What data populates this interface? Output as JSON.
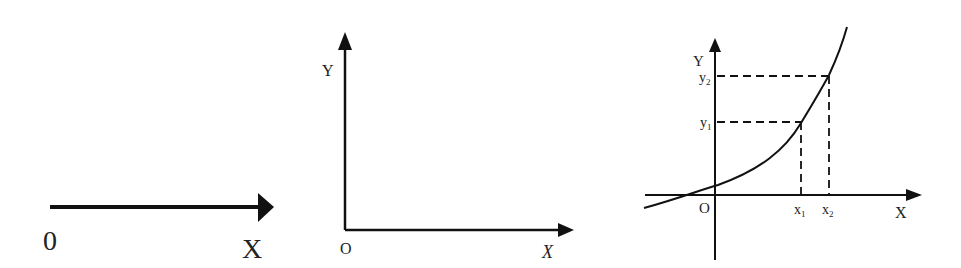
{
  "diagrams": [
    {
      "id": "number-line",
      "labels": {
        "origin": "0",
        "x_axis": "X"
      }
    },
    {
      "id": "empty-axes",
      "labels": {
        "origin": "O",
        "x_axis": "X",
        "y_axis": "Y"
      }
    },
    {
      "id": "increasing-function",
      "labels": {
        "origin": "O",
        "x_axis": "X",
        "y_axis": "Y",
        "x1": "x",
        "x1_sub": "1",
        "x2": "x",
        "x2_sub": "2",
        "y1": "y",
        "y1_sub": "1",
        "y2": "y",
        "y2_sub": "2"
      }
    }
  ],
  "colors": {
    "stroke": "#111111",
    "text": "#222222",
    "background": "#ffffff"
  }
}
